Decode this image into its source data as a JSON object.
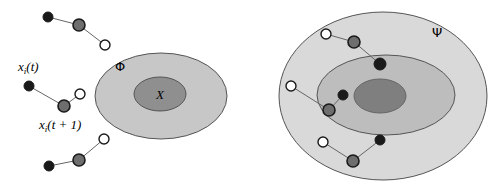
{
  "figure": {
    "background_color": "#ffffff",
    "width": 500,
    "height": 184
  },
  "colors": {
    "outline": "#555555",
    "line": "#666666",
    "band_outer": "#d9d9d9",
    "band_middle": "#bdbdbd",
    "core_dark": "#7f7f7f",
    "phi_fill": "#c7c7c7",
    "x_fill": "#8f8f8f",
    "marker_black": "#1a1a1a",
    "marker_gray": "#6e6e6e",
    "marker_open": "#ffffff",
    "text": "#000000"
  },
  "left_panel": {
    "name": "left-diagram",
    "regions": [
      {
        "id": "phi-region",
        "label": "Φ",
        "label_x": 120,
        "label_y": 71,
        "cx": 161,
        "cy": 96,
        "rx": 66,
        "ry": 43,
        "fill": "#c7c7c7"
      },
      {
        "id": "x-region",
        "label": "X",
        "label_x": 160,
        "label_y": 99,
        "cx": 160,
        "cy": 94,
        "rx": 26,
        "ry": 17,
        "fill": "#8f8f8f"
      }
    ],
    "chains": [
      {
        "id": "chain-top-left",
        "points": [
          {
            "type": "filled-black",
            "x": 48,
            "y": 17,
            "r": 5
          },
          {
            "type": "filled-gray",
            "x": 79,
            "y": 25,
            "r": 6
          },
          {
            "type": "open",
            "x": 105,
            "y": 45,
            "r": 5
          }
        ]
      },
      {
        "id": "chain-middle-left",
        "points": [
          {
            "type": "filled-black",
            "x": 29,
            "y": 86,
            "r": 5
          },
          {
            "type": "filled-gray",
            "x": 64,
            "y": 106,
            "r": 6
          },
          {
            "type": "open",
            "x": 80,
            "y": 94,
            "r": 5
          }
        ]
      },
      {
        "id": "chain-bottom-left",
        "points": [
          {
            "type": "filled-black",
            "x": 49,
            "y": 166,
            "r": 5
          },
          {
            "type": "filled-gray",
            "x": 79,
            "y": 160,
            "r": 6
          },
          {
            "type": "open",
            "x": 104,
            "y": 139,
            "r": 5
          }
        ]
      }
    ],
    "annotations": [
      {
        "id": "label-xi-t",
        "text_parts": {
          "base": "x",
          "sub": "i",
          "arg": "(t)"
        },
        "x": 18,
        "y": 71
      },
      {
        "id": "label-xi-t-plus-1",
        "text_parts": {
          "base": "x",
          "sub": "i",
          "arg": "(t + 1)"
        },
        "x": 39,
        "y": 129
      }
    ]
  },
  "right_panel": {
    "name": "right-diagram",
    "regions": [
      {
        "id": "psi-region",
        "label": "Ψ",
        "label_x": 437,
        "label_y": 37,
        "cx": 383,
        "cy": 96,
        "rx": 104,
        "ry": 84,
        "fill": "#d9d9d9"
      },
      {
        "id": "psi-middle-region",
        "label": "",
        "cx": 386,
        "cy": 95,
        "rx": 69,
        "ry": 40,
        "fill": "#bdbdbd"
      },
      {
        "id": "psi-core-region",
        "label": "",
        "cx": 380,
        "cy": 96,
        "rx": 26,
        "ry": 17,
        "fill": "#7f7f7f"
      }
    ],
    "chains": [
      {
        "id": "chain-top-right",
        "points": [
          {
            "type": "open",
            "x": 326,
            "y": 34,
            "r": 5
          },
          {
            "type": "filled-gray",
            "x": 354,
            "y": 42,
            "r": 6
          },
          {
            "type": "filled-black",
            "x": 380,
            "y": 64,
            "r": 6
          }
        ]
      },
      {
        "id": "chain-middle-right",
        "points": [
          {
            "type": "open",
            "x": 291,
            "y": 86,
            "r": 5
          },
          {
            "type": "filled-gray",
            "x": 329,
            "y": 110,
            "r": 6
          },
          {
            "type": "filled-black",
            "x": 343,
            "y": 95,
            "r": 5
          }
        ]
      },
      {
        "id": "chain-bottom-right",
        "points": [
          {
            "type": "open",
            "x": 323,
            "y": 142,
            "r": 5
          },
          {
            "type": "filled-gray",
            "x": 353,
            "y": 161,
            "r": 6
          },
          {
            "type": "filled-black",
            "x": 380,
            "y": 140,
            "r": 5
          }
        ]
      }
    ]
  }
}
